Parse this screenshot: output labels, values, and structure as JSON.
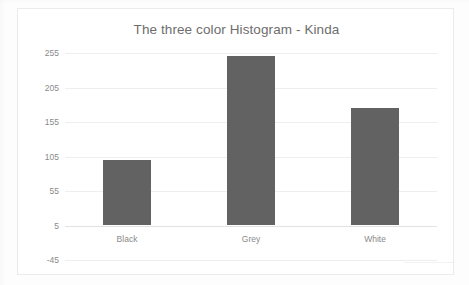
{
  "chart_data": {
    "type": "bar",
    "title": "The three color Histogram - Kinda",
    "categories": [
      "Black",
      "Grey",
      "White"
    ],
    "values": [
      100,
      250,
      176
    ],
    "series": [
      {
        "name": "Count",
        "values": [
          100,
          250,
          176
        ]
      }
    ],
    "xlabel": "",
    "ylabel": "",
    "ylim": [
      -45,
      255
    ],
    "yticks": [
      255,
      205,
      155,
      105,
      55,
      5,
      -45
    ],
    "ytick_labels": [
      "255",
      "205",
      "155",
      "105",
      "55",
      "5",
      "-45"
    ],
    "grid": true,
    "legend": false,
    "bar_color": "#626262",
    "gridline_color": "#eeeeee",
    "axis_color": "#e2e2e2",
    "title_color": "#6d6d6d",
    "tick_label_color": "#8a8a8a",
    "plot_background": "#ffffff",
    "frame_border_color": "#ebebeb"
  }
}
